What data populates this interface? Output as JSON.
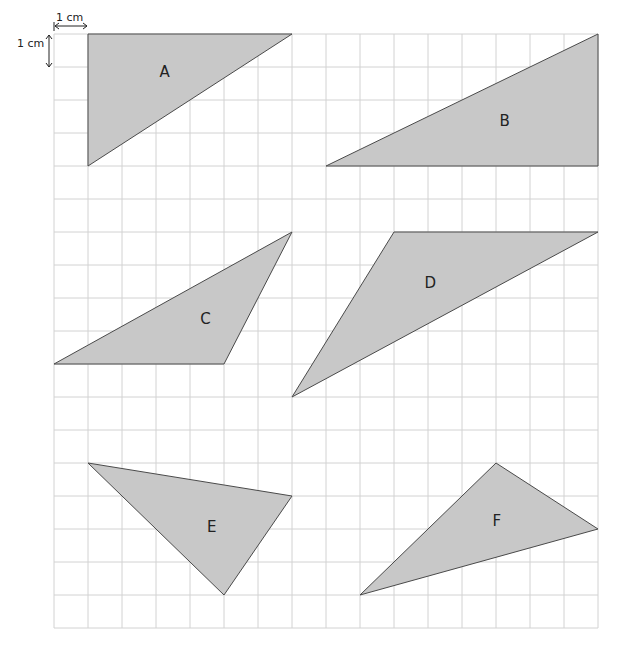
{
  "grid": {
    "origin_x": 54,
    "origin_y": 34,
    "cell_w": 34,
    "cell_h": 33,
    "cols": 16,
    "rows": 18,
    "line_color": "#d2d2d2"
  },
  "scale": {
    "horizontal_label": "1 cm",
    "vertical_label": "1 cm"
  },
  "style": {
    "fill_color": "#c8c8c8",
    "stroke_color": "#4a4a4a"
  },
  "triangles": [
    {
      "label": "A",
      "vertices": [
        [
          1,
          0
        ],
        [
          7,
          0
        ],
        [
          1,
          4
        ]
      ],
      "label_pos": [
        3.1,
        1.3
      ]
    },
    {
      "label": "B",
      "vertices": [
        [
          8,
          4
        ],
        [
          16,
          4
        ],
        [
          16,
          0
        ]
      ],
      "label_pos": [
        13.1,
        2.8
      ]
    },
    {
      "label": "C",
      "vertices": [
        [
          0,
          10
        ],
        [
          5,
          10
        ],
        [
          7,
          6
        ]
      ],
      "label_pos": [
        4.3,
        8.8
      ]
    },
    {
      "label": "D",
      "vertices": [
        [
          7,
          11
        ],
        [
          10,
          6
        ],
        [
          16,
          6
        ]
      ],
      "label_pos": [
        10.9,
        7.7
      ]
    },
    {
      "label": "E",
      "vertices": [
        [
          1,
          13
        ],
        [
          7,
          14
        ],
        [
          5,
          17
        ]
      ],
      "label_pos": [
        4.5,
        15.1
      ]
    },
    {
      "label": "F",
      "vertices": [
        [
          9,
          17
        ],
        [
          13,
          13
        ],
        [
          16,
          15
        ]
      ],
      "label_pos": [
        12.9,
        14.9
      ]
    }
  ]
}
